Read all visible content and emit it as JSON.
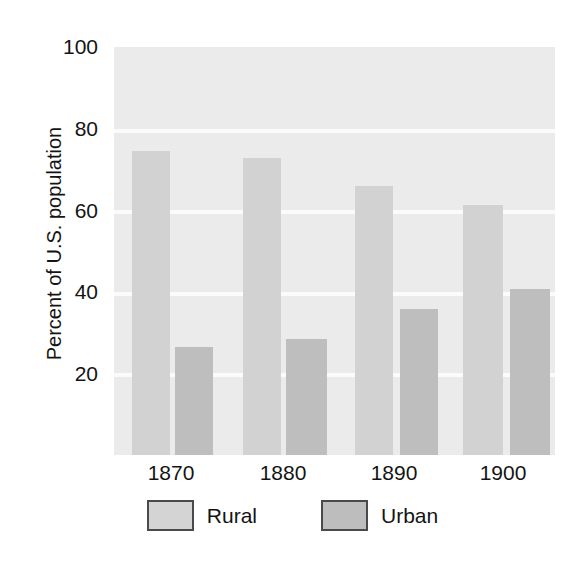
{
  "chart_data": {
    "type": "bar",
    "title": "",
    "xlabel": "",
    "ylabel": "Percent of U.S. population",
    "categories": [
      "1870",
      "1880",
      "1890",
      "1900"
    ],
    "series": [
      {
        "name": "Rural",
        "values": [
          74.5,
          72.8,
          65.9,
          61.2
        ],
        "color": "#d2d2d2"
      },
      {
        "name": "Urban",
        "values": [
          26.4,
          28.4,
          35.9,
          40.7
        ],
        "color": "#bebebe"
      }
    ],
    "ylim": [
      0,
      100
    ],
    "yticks": [
      20,
      40,
      60,
      80,
      100
    ],
    "ytick_labels": [
      "20",
      "40",
      "60",
      "80",
      "100"
    ],
    "grid": true,
    "grid_axis": "y",
    "grid_color": "#fbfbfb",
    "plot_background": "#ebebeb",
    "legend_position": "bottom-center",
    "legend_entries": [
      "Rural",
      "Urban"
    ]
  },
  "axis": {
    "y_title": "Percent of U.S. population",
    "y_ticks": [
      {
        "label": "100",
        "value": 100
      },
      {
        "label": "80",
        "value": 80
      },
      {
        "label": "60",
        "value": 60
      },
      {
        "label": "40",
        "value": 40
      },
      {
        "label": "20",
        "value": 20
      }
    ],
    "x_ticks": [
      {
        "label": "1870"
      },
      {
        "label": "1880"
      },
      {
        "label": "1890"
      },
      {
        "label": "1900"
      }
    ]
  },
  "legend": {
    "items": [
      {
        "label": "Rural",
        "swatch": "rural-swatch"
      },
      {
        "label": "Urban",
        "swatch": "urban-swatch"
      }
    ]
  }
}
